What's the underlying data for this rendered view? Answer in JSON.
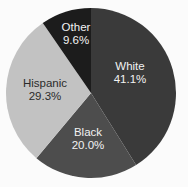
{
  "chart_data": {
    "type": "pie",
    "title": "",
    "subtitle": "",
    "xlabel": "",
    "ylabel": "",
    "legend": "none",
    "grid": false,
    "labels_inside_slices": true,
    "start_angle_deg": 0,
    "direction": "clockwise",
    "background_color": "#fbfbfb",
    "categories": [
      "White",
      "Black",
      "Hispanic",
      "Other"
    ],
    "values": [
      41.1,
      20.0,
      29.3,
      9.6
    ],
    "value_unit": "%",
    "slices": [
      {
        "label": "White",
        "value": 41.1,
        "value_text": "41.1%",
        "color": "#3a3a3a",
        "text_color": "#f2f2f2",
        "text_class": "light-text",
        "label_x": 130,
        "label_y": 67,
        "value_x": 130,
        "value_y": 80
      },
      {
        "label": "Black",
        "value": 20.0,
        "value_text": "20.0%",
        "color": "#4d4d4d",
        "text_color": "#f2f2f2",
        "text_class": "light-text",
        "label_x": 88,
        "label_y": 133,
        "value_x": 88,
        "value_y": 146
      },
      {
        "label": "Hispanic",
        "value": 29.3,
        "value_text": "29.3%",
        "color": "#c2c2c2",
        "text_color": "#2b2b2b",
        "text_class": "dark-text",
        "label_x": 45,
        "label_y": 84,
        "value_x": 45,
        "value_y": 97
      },
      {
        "label": "Other",
        "value": 9.6,
        "value_text": "9.6%",
        "color": "#1c1c1c",
        "text_color": "#f2f2f2",
        "text_class": "light-text",
        "label_x": 76,
        "label_y": 28,
        "value_x": 76,
        "value_y": 41
      }
    ],
    "geometry": {
      "center_x": 91,
      "center_y": 93,
      "radius": 85
    }
  }
}
